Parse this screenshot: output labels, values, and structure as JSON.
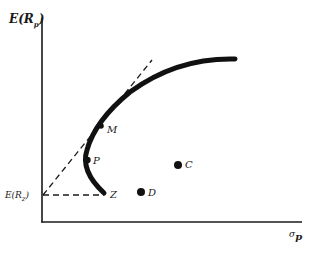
{
  "diagram": {
    "type": "efficient-frontier",
    "y_axis": {
      "label": "E(R",
      "label_sub": "p",
      "label_close": ")"
    },
    "x_axis": {
      "label": "σ",
      "label_sub": "p"
    },
    "risk_free": {
      "label": "E(R",
      "label_sub": "z",
      "label_close": ")"
    },
    "points": [
      {
        "id": "M",
        "label": "M"
      },
      {
        "id": "P",
        "label": "P"
      },
      {
        "id": "Z",
        "label": "Z"
      },
      {
        "id": "C",
        "label": "C"
      },
      {
        "id": "D",
        "label": "D"
      }
    ],
    "colors": {
      "ink": "#1a1a1a",
      "background": "#ffffff"
    }
  }
}
